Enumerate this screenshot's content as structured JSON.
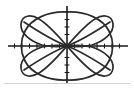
{
  "figure": {
    "title": "",
    "caption": "",
    "background_color": "#ffffff",
    "curve_color": "#2b2b2b",
    "axis_color": "#1a1a1a",
    "rule_color": "#d2d2d2"
  },
  "chart_data": {
    "type": "line",
    "title": "",
    "subtitle": "",
    "xlabel": "",
    "ylabel": "",
    "grid": false,
    "legend": "none",
    "axes": {
      "x_axis_visible": true,
      "y_axis_visible": true,
      "origin_px": [
        67,
        46
      ],
      "x_axis_extent_px": [
        8,
        128
      ],
      "y_axis_extent_px": [
        6,
        84
      ],
      "x_tick_count": 16,
      "y_tick_count": 10,
      "x_tick_spacing_px": 7.5,
      "y_tick_spacing_px": 7.5,
      "tick_labels_shown": false,
      "xlim": [
        -8,
        8
      ],
      "ylim": [
        -5.3,
        5.3
      ]
    },
    "annotations": [],
    "series": [
      {
        "name": "lobe-upper-right",
        "values": [],
        "path": "M 67 46 C 76 36, 90 22, 101 18 C 110 15, 116 20, 114 28 C 112 38, 100 44, 88 48"
      },
      {
        "name": "lobe-lower-right",
        "values": [],
        "path": "M 67 46 C 76 56, 90 70, 101 74 C 110 77, 116 72, 114 64 C 112 54, 100 48, 88 44"
      },
      {
        "name": "lobe-upper-left",
        "values": [],
        "path": "M 67 46 C 58 36, 44 22, 33 18 C 24 15, 18 20, 20 28 C 22 38, 34 44, 46 48"
      },
      {
        "name": "lobe-lower-left",
        "values": [],
        "path": "M 67 46 C 58 56, 44 70, 33 74 C 24 77, 18 72, 20 64 C 22 54, 34 48, 46 44"
      },
      {
        "name": "outer-loop-right",
        "values": [],
        "path": "M 67 12 C 86 12, 103 20, 109 32 C 114 42, 114 50, 109 60 C 103 72, 86 80, 67 80"
      },
      {
        "name": "outer-loop-left",
        "values": [],
        "path": "M 67 12 C 48 12, 31 20, 25 32 C 20 42, 20 50, 25 60 C 31 72, 48 80, 67 80"
      }
    ],
    "key_points": {
      "x_axis_crossings_px": [
        30,
        67,
        103
      ],
      "y_axis_crossings_px": [
        12,
        46,
        80
      ],
      "leftmost_px": 20,
      "rightmost_px": 114,
      "topmost_px": 12,
      "bottommost_px": 80
    }
  },
  "decorations": {
    "baseline_rule": {
      "y_px": 83,
      "x_start_px": 4,
      "x_end_px": 130
    }
  }
}
